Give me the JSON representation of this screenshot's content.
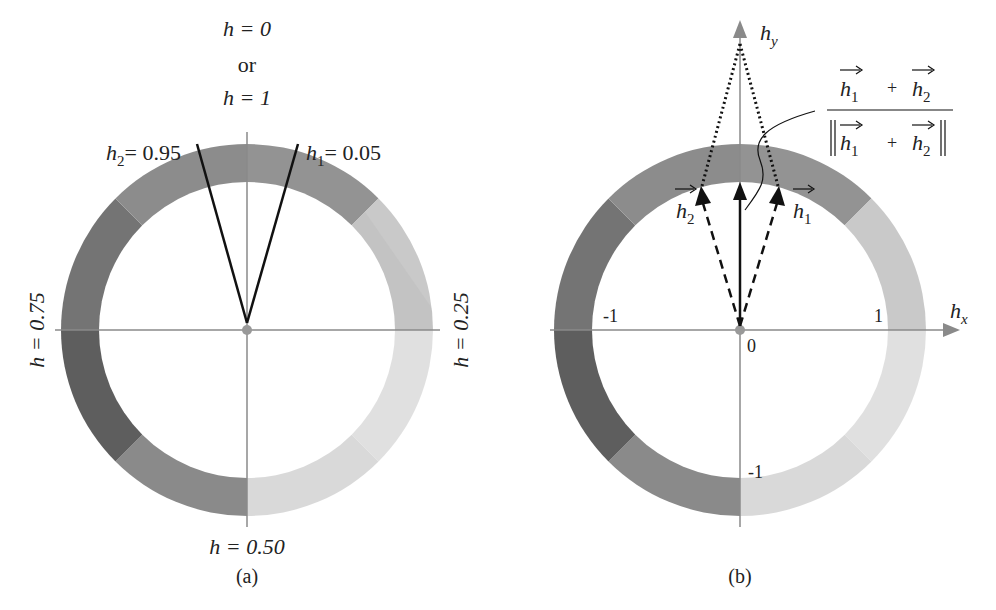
{
  "panel_a": {
    "caption": "(a)",
    "top_label_line1": "h = 0",
    "top_label_or": "or",
    "top_label_line2": "h = 1",
    "right_label": "h = 0.25",
    "bottom_label": "h = 0.50",
    "left_label": "h = 0.75",
    "h1_label": "h",
    "h1_sub": "1",
    "h1_value": "= 0.05",
    "h2_label": "h",
    "h2_sub": "2",
    "h2_value": "= 0.95"
  },
  "panel_b": {
    "caption": "(b)",
    "x_axis_label": "h",
    "x_axis_sub": "x",
    "y_axis_label": "h",
    "y_axis_sub": "y",
    "origin_label": "0",
    "tick_x_pos": "1",
    "tick_x_neg": "-1",
    "tick_y_neg": "-1",
    "vec_h1": "h",
    "vec_h1_sub": "1",
    "vec_h2": "h",
    "vec_h2_sub": "2",
    "formula_num_h1": "h",
    "formula_num_h1_sub": "1",
    "formula_num_plus": "+",
    "formula_num_h2": "h",
    "formula_num_h2_sub": "2",
    "formula_den_h1": "h",
    "formula_den_h1_sub": "1",
    "formula_den_plus": "+",
    "formula_den_h2": "h",
    "formula_den_h2_sub": "2"
  },
  "colors": {
    "ring_dark": "#5a5a5a",
    "ring_mid": "#8e8e8e",
    "ring_light": "#e2e2e2",
    "axis": "#8a8a8a",
    "vector": "#111111"
  }
}
